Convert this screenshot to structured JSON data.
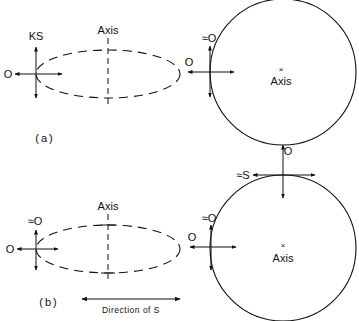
{
  "panels": [
    {
      "id": "a",
      "caption": "(a)",
      "ellipse": {
        "axis_label": "Axis",
        "edge_labels": {
          "vertical": "KS",
          "horizontal": "O"
        }
      },
      "circle": {
        "axis_label": "Axis",
        "axis_marker": "×",
        "left_edge_labels": {
          "vertical": "≈O",
          "horizontal": "O"
        }
      }
    },
    {
      "id": "b",
      "caption": "(b)",
      "ellipse": {
        "axis_label": "Axis",
        "edge_labels": {
          "vertical": "≈O",
          "horizontal": "O"
        }
      },
      "circle": {
        "axis_label": "Axis",
        "axis_marker": "×",
        "left_edge_labels": {
          "vertical": "≈O",
          "horizontal": "O"
        },
        "top_edge_labels": {
          "vertical": "O",
          "horizontal": "≈S"
        }
      },
      "direction_arrow": {
        "label": "Direction of S"
      }
    }
  ],
  "colors": {
    "ink": "#111111",
    "background": "#ffffff"
  }
}
